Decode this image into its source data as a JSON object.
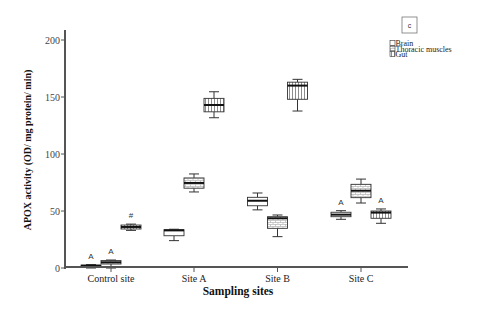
{
  "chart_data": {
    "type": "boxplot",
    "panel_label": "c",
    "title": "",
    "xlabel": "Sampling sites",
    "ylabel": "APOX activity (OD/ mg protein/ min)",
    "ylim": [
      0,
      210
    ],
    "yticks": [
      0,
      50,
      100,
      150,
      200
    ],
    "grid": false,
    "categories": [
      "Control site",
      "Site A",
      "Site B",
      "Site C"
    ],
    "legend": {
      "position": "upper right",
      "entries": [
        {
          "label": "Brain",
          "pattern": "plain"
        },
        {
          "label": "Thoracic muscles",
          "pattern": "grid"
        },
        {
          "label": "Gut",
          "pattern": "vertical-lines"
        }
      ]
    },
    "box_value_order": [
      "min",
      "q1",
      "median",
      "q3",
      "max"
    ],
    "series": [
      {
        "name": "Brain",
        "pattern": "plain",
        "boxes": [
          [
            0,
            1,
            2,
            2.5,
            3
          ],
          [
            24,
            28.3,
            33,
            33.6,
            34
          ],
          [
            51,
            54.6,
            59,
            62,
            65.8
          ],
          [
            42.7,
            45,
            46.8,
            48.9,
            50.3
          ]
        ],
        "annotations": [
          "A",
          "",
          "",
          "A"
        ]
      },
      {
        "name": "Thoracic muscles",
        "pattern": "grid",
        "boxes": [
          [
            0,
            3.5,
            5,
            6.5,
            7
          ],
          [
            66.7,
            70,
            74.6,
            79,
            82.5
          ],
          [
            27.5,
            34.8,
            43.6,
            45,
            46.5
          ],
          [
            57,
            61.7,
            67.8,
            73.4,
            78
          ]
        ],
        "annotations": [
          "A",
          "",
          "",
          ""
        ]
      },
      {
        "name": "Gut",
        "pattern": "vertical-lines",
        "boxes": [
          [
            33,
            34.2,
            36,
            37.7,
            38.5
          ],
          [
            131.8,
            137,
            143,
            148.8,
            154.6
          ],
          [
            137.7,
            148,
            160,
            163,
            165.5
          ],
          [
            39.2,
            43.6,
            48.6,
            50,
            51.8
          ]
        ],
        "annotations": [
          "#",
          "",
          "",
          "A"
        ]
      }
    ]
  }
}
